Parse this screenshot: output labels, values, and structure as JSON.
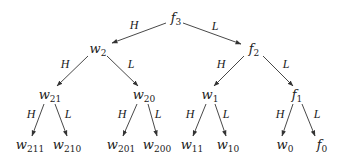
{
  "diagram": {
    "type": "binary-tree",
    "nodes": [
      {
        "id": "f3",
        "base": "f",
        "sub": "3",
        "x": 176,
        "y": 19
      },
      {
        "id": "w2",
        "base": "w",
        "sub": "2",
        "x": 98,
        "y": 50
      },
      {
        "id": "f2",
        "base": "f",
        "sub": "2",
        "x": 254,
        "y": 50
      },
      {
        "id": "w21",
        "base": "w",
        "sub": "21",
        "x": 50,
        "y": 96
      },
      {
        "id": "w20",
        "base": "w",
        "sub": "20",
        "x": 144,
        "y": 96
      },
      {
        "id": "w1",
        "base": "w",
        "sub": "1",
        "x": 210,
        "y": 96
      },
      {
        "id": "f1",
        "base": "f",
        "sub": "1",
        "x": 297,
        "y": 96
      },
      {
        "id": "w211",
        "base": "w",
        "sub": "211",
        "x": 30,
        "y": 146
      },
      {
        "id": "w210",
        "base": "w",
        "sub": "210",
        "x": 67,
        "y": 146
      },
      {
        "id": "w201",
        "base": "w",
        "sub": "201",
        "x": 121,
        "y": 146
      },
      {
        "id": "w200",
        "base": "w",
        "sub": "200",
        "x": 157,
        "y": 146
      },
      {
        "id": "w11",
        "base": "w",
        "sub": "11",
        "x": 192,
        "y": 146
      },
      {
        "id": "w10",
        "base": "w",
        "sub": "10",
        "x": 228,
        "y": 146
      },
      {
        "id": "w0",
        "base": "w",
        "sub": "0",
        "x": 285,
        "y": 146
      },
      {
        "id": "f0",
        "base": "f",
        "sub": "0",
        "x": 322,
        "y": 146
      }
    ],
    "edges": [
      {
        "from": "f3",
        "to": "w2",
        "label": "H",
        "x1": 166,
        "y1": 23,
        "x2": 112,
        "y2": 43,
        "lx": 134,
        "ly": 25
      },
      {
        "from": "f3",
        "to": "f2",
        "label": "L",
        "x1": 183,
        "y1": 23,
        "x2": 241,
        "y2": 44,
        "lx": 215,
        "ly": 26
      },
      {
        "from": "w2",
        "to": "w21",
        "label": "H",
        "x1": 88,
        "y1": 56,
        "x2": 57,
        "y2": 86,
        "lx": 65,
        "ly": 64
      },
      {
        "from": "w2",
        "to": "w20",
        "label": "L",
        "x1": 107,
        "y1": 56,
        "x2": 138,
        "y2": 86,
        "lx": 131,
        "ly": 64
      },
      {
        "from": "f2",
        "to": "w1",
        "label": "H",
        "x1": 244,
        "y1": 56,
        "x2": 214,
        "y2": 86,
        "lx": 221,
        "ly": 64
      },
      {
        "from": "f2",
        "to": "f1",
        "label": "L",
        "x1": 263,
        "y1": 56,
        "x2": 293,
        "y2": 86,
        "lx": 286,
        "ly": 64
      },
      {
        "from": "w21",
        "to": "w211",
        "label": "H",
        "x1": 44,
        "y1": 104,
        "x2": 32,
        "y2": 136,
        "lx": 31,
        "ly": 114
      },
      {
        "from": "w21",
        "to": "w210",
        "label": "L",
        "x1": 55,
        "y1": 104,
        "x2": 67,
        "y2": 136,
        "lx": 68,
        "ly": 114
      },
      {
        "from": "w20",
        "to": "w201",
        "label": "H",
        "x1": 137,
        "y1": 104,
        "x2": 123,
        "y2": 136,
        "lx": 122,
        "ly": 114
      },
      {
        "from": "w20",
        "to": "w200",
        "label": "L",
        "x1": 148,
        "y1": 104,
        "x2": 157,
        "y2": 136,
        "lx": 158,
        "ly": 114
      },
      {
        "from": "w1",
        "to": "w11",
        "label": "H",
        "x1": 206,
        "y1": 104,
        "x2": 193,
        "y2": 136,
        "lx": 190,
        "ly": 114
      },
      {
        "from": "w1",
        "to": "w10",
        "label": "L",
        "x1": 215,
        "y1": 104,
        "x2": 226,
        "y2": 136,
        "lx": 226,
        "ly": 114
      },
      {
        "from": "f1",
        "to": "w0",
        "label": "H",
        "x1": 293,
        "y1": 104,
        "x2": 282,
        "y2": 136,
        "lx": 280,
        "ly": 114
      },
      {
        "from": "f1",
        "to": "f0",
        "label": "L",
        "x1": 302,
        "y1": 104,
        "x2": 315,
        "y2": 136,
        "lx": 317,
        "ly": 114
      }
    ],
    "colors": {
      "line": "#333333",
      "text": "#222222",
      "background": "#ffffff"
    }
  }
}
